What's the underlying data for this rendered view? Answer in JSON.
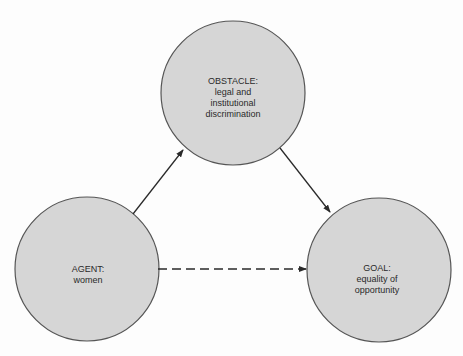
{
  "colors": {
    "background": "#fdfdfd",
    "node_fill": "#d6d6d6",
    "node_stroke": "#555555",
    "arrow": "#2a2a2a",
    "text": "#2a2a2a"
  },
  "nodes": {
    "obstacle": {
      "heading": "OBSTACLE:",
      "lines": [
        "legal and",
        "institutional",
        "discrimination"
      ],
      "cx": 233,
      "cy": 93,
      "r": 72
    },
    "agent": {
      "heading": "AGENT:",
      "lines": [
        "women"
      ],
      "cx": 87,
      "cy": 269,
      "r": 72
    },
    "goal": {
      "heading": "GOAL:",
      "lines": [
        "equality of",
        "opportunity"
      ],
      "cx": 379,
      "cy": 270,
      "r": 72
    }
  },
  "edges": [
    {
      "from": "agent",
      "to": "obstacle",
      "style": "solid",
      "x1": 133,
      "y1": 214,
      "x2": 183,
      "y2": 150
    },
    {
      "from": "obstacle",
      "to": "goal",
      "style": "solid",
      "x1": 280,
      "y1": 148,
      "x2": 330,
      "y2": 212
    },
    {
      "from": "agent",
      "to": "goal",
      "style": "dashed",
      "x1": 158,
      "y1": 269,
      "x2": 306,
      "y2": 269
    }
  ]
}
